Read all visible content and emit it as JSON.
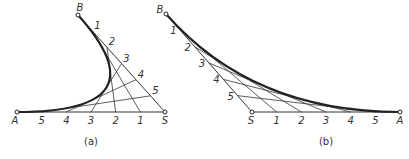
{
  "colors": {
    "background": "#ffffff",
    "stroke": "#222222",
    "thin_stroke": "#333333",
    "text": "#333333"
  },
  "figure_a": {
    "caption": "(a)",
    "points": {
      "A": [
        17,
        112
      ],
      "S": [
        165,
        112
      ],
      "B": [
        78,
        15
      ]
    },
    "labels": {
      "A": "A",
      "B": "B",
      "S": "S"
    },
    "baseline_divisions": [
      "5",
      "4",
      "3",
      "2",
      "1"
    ],
    "side_divisions": [
      "1",
      "2",
      "3",
      "4",
      "5"
    ]
  },
  "figure_b": {
    "caption": "(b)",
    "points": {
      "S": [
        252,
        112
      ],
      "A": [
        400,
        112
      ],
      "B": [
        166,
        14
      ]
    },
    "labels": {
      "A": "A",
      "B": "B",
      "S": "S"
    },
    "baseline_divisions": [
      "1",
      "2",
      "3",
      "4",
      "5"
    ],
    "side_divisions": [
      "1",
      "2",
      "3",
      "4",
      "5"
    ]
  }
}
